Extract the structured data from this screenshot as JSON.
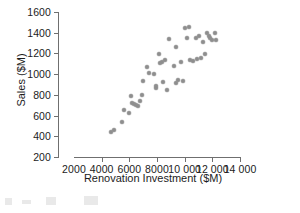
{
  "chart_data": {
    "type": "scatter",
    "title": "",
    "xlabel": "Renovation Investment ($M)",
    "ylabel": "Sales ($M)",
    "xlim": [
      2000,
      14000
    ],
    "ylim": [
      200,
      1600
    ],
    "xticks": [
      2000,
      4000,
      6000,
      8000,
      10000,
      12000,
      14000
    ],
    "xtick_labels": [
      "2000",
      "4000",
      "6000",
      "8000",
      "10 000",
      "12 000",
      "14 000"
    ],
    "yticks": [
      200,
      400,
      600,
      800,
      1000,
      1200,
      1400,
      1600
    ],
    "ytick_labels": [
      "200",
      "400",
      "600",
      "800",
      "1000",
      "1200",
      "1400",
      "1600"
    ],
    "grid": false,
    "legend": null,
    "marker_color": "#8e8e8e",
    "axis_color": "#6f6f6f",
    "text_color": "#1c1c1c",
    "points": [
      {
        "x": 4650,
        "y": 445
      },
      {
        "x": 4900,
        "y": 462
      },
      {
        "x": 5450,
        "y": 540
      },
      {
        "x": 5600,
        "y": 650
      },
      {
        "x": 5950,
        "y": 625
      },
      {
        "x": 6100,
        "y": 790
      },
      {
        "x": 6200,
        "y": 718
      },
      {
        "x": 6350,
        "y": 712
      },
      {
        "x": 6500,
        "y": 700
      },
      {
        "x": 6600,
        "y": 695
      },
      {
        "x": 6750,
        "y": 742
      },
      {
        "x": 6950,
        "y": 795
      },
      {
        "x": 7000,
        "y": 930
      },
      {
        "x": 7300,
        "y": 1070
      },
      {
        "x": 7450,
        "y": 1015
      },
      {
        "x": 7800,
        "y": 1000
      },
      {
        "x": 7900,
        "y": 885
      },
      {
        "x": 7950,
        "y": 870
      },
      {
        "x": 8150,
        "y": 1195
      },
      {
        "x": 8200,
        "y": 1105
      },
      {
        "x": 8350,
        "y": 1120
      },
      {
        "x": 8400,
        "y": 925
      },
      {
        "x": 8600,
        "y": 1140
      },
      {
        "x": 8700,
        "y": 845
      },
      {
        "x": 8900,
        "y": 1340
      },
      {
        "x": 9250,
        "y": 1080
      },
      {
        "x": 9350,
        "y": 1260
      },
      {
        "x": 9400,
        "y": 915
      },
      {
        "x": 9550,
        "y": 940
      },
      {
        "x": 9700,
        "y": 1115
      },
      {
        "x": 9850,
        "y": 930
      },
      {
        "x": 10050,
        "y": 1450
      },
      {
        "x": 10150,
        "y": 1345
      },
      {
        "x": 10300,
        "y": 1460
      },
      {
        "x": 10400,
        "y": 1135
      },
      {
        "x": 10600,
        "y": 1130
      },
      {
        "x": 10800,
        "y": 1345
      },
      {
        "x": 10900,
        "y": 1150
      },
      {
        "x": 11050,
        "y": 1370
      },
      {
        "x": 11200,
        "y": 1155
      },
      {
        "x": 11350,
        "y": 1310
      },
      {
        "x": 11450,
        "y": 1190
      },
      {
        "x": 11600,
        "y": 1400
      },
      {
        "x": 11750,
        "y": 1370
      },
      {
        "x": 11850,
        "y": 1350
      },
      {
        "x": 12000,
        "y": 1330
      },
      {
        "x": 12200,
        "y": 1400
      },
      {
        "x": 12300,
        "y": 1325
      }
    ]
  }
}
